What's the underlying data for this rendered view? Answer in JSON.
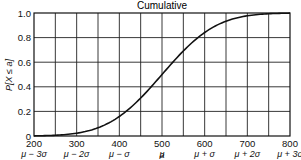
{
  "chart_data": {
    "type": "line",
    "title": "Cumulative",
    "xlabel": "a",
    "ylabel": "P[X ≤ a]",
    "xlim": [
      200,
      800
    ],
    "ylim": [
      0,
      1.0
    ],
    "grid": true,
    "legend": null,
    "x_ticks": [
      200,
      300,
      400,
      500,
      600,
      700,
      800
    ],
    "x_tick_labels": [
      "200",
      "300",
      "400",
      "500",
      "600",
      "700",
      "800"
    ],
    "x_tick_sublabels": [
      "μ − 3σ",
      "μ − 2σ",
      "μ − σ",
      "μ",
      "μ + σ",
      "μ + 2σ",
      "μ + 3σ"
    ],
    "x_grid_step": 50,
    "y_ticks": [
      0,
      0.2,
      0.4,
      0.6,
      0.8,
      1.0
    ],
    "y_tick_labels": [
      "0",
      "0.2",
      "0.4",
      "0.6",
      "0.8",
      "1.0"
    ],
    "y_grid_step": 0.2,
    "distribution": {
      "name": "normal CDF",
      "mu": 500,
      "sigma": 100
    },
    "series": [
      {
        "name": "Cumulative",
        "x": [
          200,
          250,
          300,
          350,
          400,
          450,
          500,
          550,
          600,
          650,
          700,
          750,
          800
        ],
        "y": [
          0.001,
          0.006,
          0.023,
          0.067,
          0.159,
          0.309,
          0.5,
          0.691,
          0.841,
          0.933,
          0.977,
          0.994,
          0.999
        ]
      }
    ]
  }
}
